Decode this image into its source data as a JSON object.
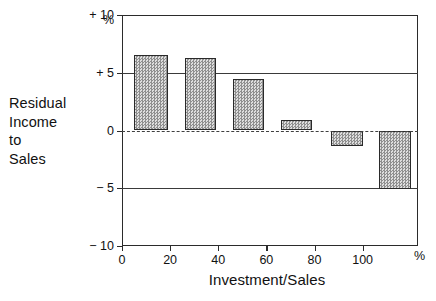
{
  "chart_data": {
    "type": "bar",
    "title": "",
    "ylabel": "Residual Income to Sales",
    "ylabel_lines": [
      "Residual",
      "Income",
      "to",
      "Sales"
    ],
    "xlabel": "Investment/Sales",
    "y_unit": "%",
    "x_unit": "%",
    "ylim": [
      -10,
      10
    ],
    "xlim": [
      0,
      123
    ],
    "grid": true,
    "legend": "none",
    "zero_line": true,
    "y_ticks": [
      {
        "value": 10,
        "label": "+ 10"
      },
      {
        "value": 5,
        "label": "+ 5"
      },
      {
        "value": 0,
        "label": "0"
      },
      {
        "value": -5,
        "label": "− 5"
      },
      {
        "value": -10,
        "label": "− 10"
      }
    ],
    "x_ticks": [
      {
        "value": 0,
        "label": "0"
      },
      {
        "value": 20,
        "label": "20"
      },
      {
        "value": 40,
        "label": "40"
      },
      {
        "value": 60,
        "label": "60"
      },
      {
        "value": 80,
        "label": "80"
      },
      {
        "value": 100,
        "label": "100"
      }
    ],
    "categories": [
      "5-19",
      "25-39",
      "45-59",
      "65-79",
      "85-99",
      "105-119"
    ],
    "values": [
      6.5,
      6.3,
      4.5,
      0.9,
      -1.3,
      -5.1
    ],
    "bars": [
      {
        "x_start": 5,
        "x_end": 19,
        "value": 6.5
      },
      {
        "x_start": 26,
        "x_end": 39,
        "value": 6.3
      },
      {
        "x_start": 46,
        "x_end": 59,
        "value": 4.5
      },
      {
        "x_start": 66,
        "x_end": 79,
        "value": 0.9
      },
      {
        "x_start": 87,
        "x_end": 100,
        "value": -1.3
      },
      {
        "x_start": 107,
        "x_end": 120,
        "value": -5.1
      }
    ],
    "colors": {
      "bar_fill": "#b9b9b9",
      "bar_border": "#2a2a2a",
      "axis": "#2b2b2b",
      "grid": "#3a3a3a",
      "background": "#ffffff",
      "text": "#111111"
    }
  }
}
